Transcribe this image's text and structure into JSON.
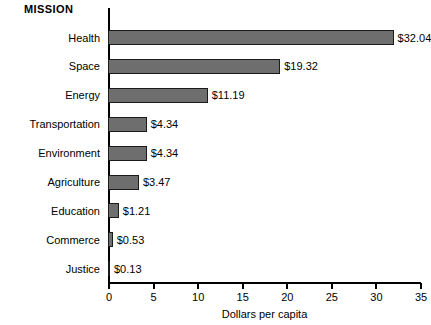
{
  "chart_data": {
    "type": "bar",
    "orientation": "horizontal",
    "title": "MISSION",
    "xlabel": "Dollars per capita",
    "ylabel": "MISSION",
    "categories": [
      "Health",
      "Space",
      "Energy",
      "Transportation",
      "Environment",
      "Agriculture",
      "Education",
      "Commerce",
      "Justice"
    ],
    "values": [
      32.04,
      19.32,
      11.19,
      4.34,
      4.34,
      3.47,
      1.21,
      0.53,
      0.13
    ],
    "value_labels": [
      "$32.04",
      "$19.32",
      "$11.19",
      "$4.34",
      "$4.34",
      "$3.47",
      "$1.21",
      "$0.53",
      "$0.13"
    ],
    "xlim": [
      0,
      35
    ],
    "xticks": [
      0,
      5,
      10,
      15,
      20,
      25,
      30,
      35
    ],
    "xtick_labels": [
      "0",
      "5",
      "10",
      "15",
      "20",
      "25",
      "30",
      "35"
    ],
    "grid": false,
    "legend": null,
    "bar_color": "#6e6e6e",
    "bar_border_color": "#1a1a1a",
    "axis_color": "#000000",
    "background_color": "#ffffff",
    "text_color": "#000000"
  }
}
